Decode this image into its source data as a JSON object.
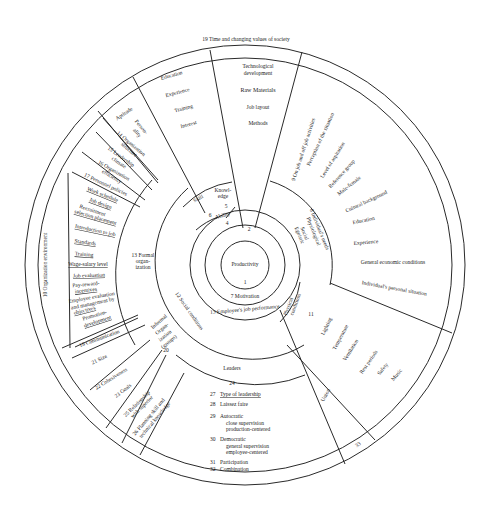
{
  "diagram": {
    "center": {
      "label": "Productivity",
      "number": "1"
    },
    "motivation": "7 Motivation",
    "performance": "13 Employee's job performance",
    "top_wedge_number": "2",
    "ability": {
      "label": "Ability",
      "number": "4"
    },
    "skill": {
      "label": "Skill",
      "number": "6"
    },
    "knowledge": {
      "label": "Knowl-\nedge",
      "line1": "Knowl-",
      "line2": "edge",
      "number": "5"
    },
    "outer_ring": "19 Time and changing values of society",
    "org_environment": "10 Organization environment",
    "technology": [
      "Technological",
      "development",
      "Raw Materials",
      "Job layout",
      "Methods"
    ],
    "education_sector": [
      "Education",
      "Experience",
      "Training",
      "Interest"
    ],
    "aptitude": "Aptitude",
    "personality": [
      "Person-",
      "ality"
    ],
    "org_structure": [
      "14 Organization",
      "structure"
    ],
    "leadership_climate": [
      "15 Leadership",
      "climate"
    ],
    "org_efficiency": [
      "16 Organization",
      "efficiency"
    ],
    "personnel_policies": "17 Personnel policies",
    "policies": [
      "Work schedule",
      "Job design",
      "Recruitment",
      "selection placement",
      "Introduction to job",
      "Standards",
      "Training",
      "Wage-salary level",
      "Job evaluation",
      "Pay-reward-",
      "incentives",
      "Employee evaluation",
      "and management by",
      "objectives",
      "Promotion-",
      "development"
    ],
    "formal_org": [
      "13 Formal",
      "organ-",
      "ization"
    ],
    "communication": "18 Communication",
    "size": "21 Size",
    "cohesiveness": "22 Cohesiveness",
    "goals": "23 Goals",
    "relationship": [
      "25 Relationship",
      "with superior"
    ],
    "planning": [
      "26 Planning skill and",
      "technical knowledge"
    ],
    "informal_org": [
      "Informal",
      "Organ-",
      "ization",
      "(groups)",
      "20"
    ],
    "social_conditions": "12 Social conditions",
    "leaders": {
      "label": "Leaders",
      "number": "24"
    },
    "leadership_list": [
      {
        "num": "27",
        "text": "Type of leadership"
      },
      {
        "num": "28",
        "text": "Laissez faire"
      },
      {
        "num": "29",
        "text": "Autocratic"
      },
      {
        "num": "",
        "text": "close supervision"
      },
      {
        "num": "",
        "text": "production-centered"
      },
      {
        "num": "30",
        "text": "Democratic"
      },
      {
        "num": "",
        "text": "general supervision"
      },
      {
        "num": "",
        "text": "employee-centered"
      },
      {
        "num": "31",
        "text": "Participation"
      },
      {
        "num": "32",
        "text": "Combination"
      }
    ],
    "individual_needs": [
      "8 Individual's needs",
      "Physiological",
      "Social",
      "Egoistic"
    ],
    "individual_factors": [
      "9 On job and off job activities",
      "Perception of the situation",
      "Level of aspiration",
      "Reference group",
      "Male-female",
      "Cultural background",
      "Education",
      "Experience",
      "General economic conditions",
      "Individual's personal situation"
    ],
    "physical_conditions": [
      "Physical",
      "conditions",
      "11"
    ],
    "physical_list": [
      "Lighting",
      "Temperature",
      "Ventilation",
      "Rest periods",
      "Safety",
      "Music"
    ],
    "union": {
      "label": "Union",
      "number": "33"
    }
  }
}
